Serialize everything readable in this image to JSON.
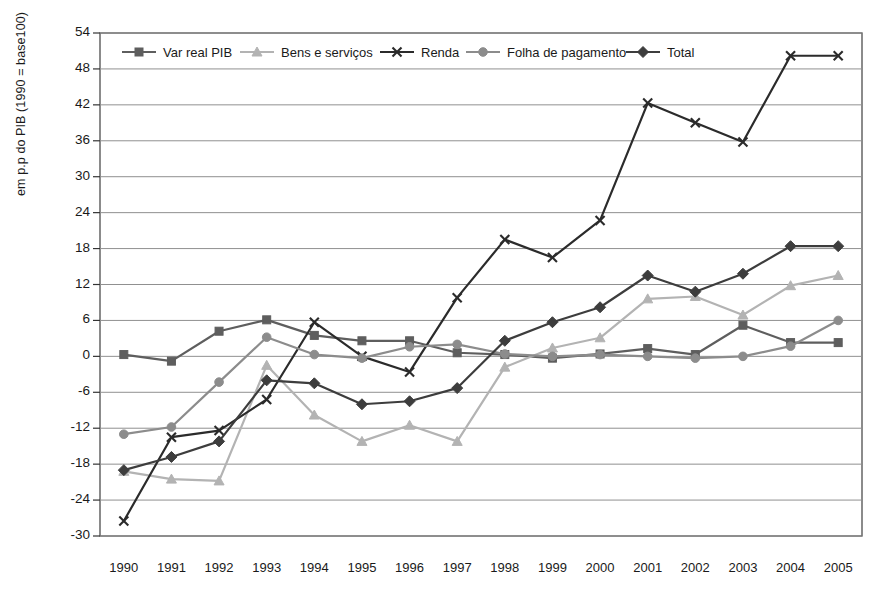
{
  "chart_data": {
    "type": "line",
    "title": "",
    "xlabel": "",
    "ylabel": "em p.p do PIB (1990 = base100)",
    "ylim": [
      -30,
      54
    ],
    "ytick_step": 6,
    "yticks": [
      54,
      48,
      42,
      36,
      30,
      24,
      18,
      12,
      6,
      0,
      -6,
      -12,
      -18,
      -24,
      -30
    ],
    "grid": true,
    "legend_position": "top-inside",
    "categories": [
      "1990",
      "1991",
      "1992",
      "1993",
      "1994",
      "1995",
      "1996",
      "1997",
      "1998",
      "1999",
      "2000",
      "2001",
      "2002",
      "2003",
      "2004",
      "2005"
    ],
    "series": [
      {
        "name": "Var real PIB",
        "color": "#5e5e5e",
        "marker": "square",
        "values": [
          0.3,
          -0.8,
          4.2,
          6.1,
          3.5,
          2.6,
          2.6,
          0.6,
          0.3,
          -0.3,
          0.4,
          1.3,
          0.3,
          5.2,
          2.3,
          2.3
        ]
      },
      {
        "name": "Bens e serviços",
        "color": "#b3b3b3",
        "marker": "triangle",
        "values": [
          -19.2,
          -20.5,
          -20.8,
          -1.5,
          -9.8,
          -14.2,
          -11.5,
          -14.2,
          -1.8,
          1.4,
          3.1,
          9.6,
          10.0,
          6.9,
          11.8,
          13.5
        ]
      },
      {
        "name": "Renda",
        "color": "#2b2b2b",
        "marker": "x",
        "values": [
          -27.5,
          -13.5,
          -12.4,
          -7.2,
          5.7,
          0.0,
          -2.6,
          9.8,
          19.5,
          16.5,
          22.7,
          42.3,
          39.0,
          35.8,
          50.2,
          50.2
        ]
      },
      {
        "name": "Folha de pagamento",
        "color": "#8c8c8c",
        "marker": "circle",
        "values": [
          -13.0,
          -11.8,
          -4.3,
          3.2,
          0.3,
          -0.3,
          1.6,
          2.0,
          0.4,
          0.0,
          0.3,
          0.0,
          -0.3,
          0.0,
          1.7,
          6.0
        ]
      },
      {
        "name": "Total",
        "color": "#3d3d3d",
        "marker": "diamond",
        "values": [
          -19.0,
          -16.8,
          -14.2,
          -4.0,
          -4.5,
          -8.0,
          -7.5,
          -5.3,
          2.6,
          5.7,
          8.2,
          13.5,
          10.8,
          13.8,
          18.4,
          18.4
        ]
      }
    ]
  }
}
